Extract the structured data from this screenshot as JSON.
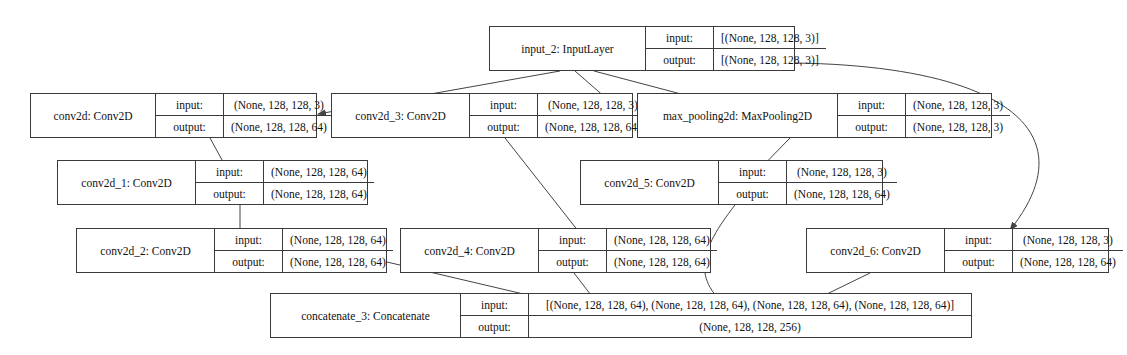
{
  "diagram": {
    "type": "directed-graph",
    "edge_color": "#444444",
    "node_border_color": "#3a3a3a",
    "node_fill": "#ffffff",
    "io_labels": {
      "input": "input:",
      "output": "output:"
    },
    "nodes": [
      {
        "id": "input_2",
        "name": "input_2: InputLayer",
        "input": "[(None, 128, 128, 3)]",
        "output": "[(None, 128, 128, 3)]",
        "x": 489,
        "y": 26,
        "w": 306,
        "h": 45,
        "namew": 141,
        "labelw": 55
      },
      {
        "id": "conv2d",
        "name": "conv2d: Conv2D",
        "input": "(None, 128, 128, 3)",
        "output": "(None, 128, 128, 64)",
        "x": 30,
        "y": 93,
        "w": 287,
        "h": 45,
        "namew": 110,
        "labelw": 55
      },
      {
        "id": "conv2d_3",
        "name": "conv2d_3: Conv2D",
        "input": "(None, 128, 128, 3)",
        "output": "(None, 128, 128, 64)",
        "x": 331,
        "y": 93,
        "w": 302,
        "h": 45,
        "namew": 123,
        "labelw": 55
      },
      {
        "id": "max_pooling2d",
        "name": "max_pooling2d: MaxPooling2D",
        "input": "(None, 128, 128, 3)",
        "output": "(None, 128, 128, 3)",
        "x": 637,
        "y": 93,
        "w": 355,
        "h": 45,
        "namew": 185,
        "labelw": 55
      },
      {
        "id": "conv2d_1",
        "name": "conv2d_1: Conv2D",
        "input": "(None, 128, 128, 64)",
        "output": "(None, 128, 128, 64)",
        "x": 57,
        "y": 160,
        "w": 311,
        "h": 45,
        "namew": 123,
        "labelw": 55
      },
      {
        "id": "conv2d_5",
        "name": "conv2d_5: Conv2D",
        "input": "(None, 128, 128, 3)",
        "output": "(None, 128, 128, 64)",
        "x": 580,
        "y": 160,
        "w": 303,
        "h": 45,
        "namew": 123,
        "labelw": 55
      },
      {
        "id": "conv2d_2",
        "name": "conv2d_2: Conv2D",
        "input": "(None, 128, 128, 64)",
        "output": "(None, 128, 128, 64)",
        "x": 76,
        "y": 228,
        "w": 311,
        "h": 45,
        "namew": 123,
        "labelw": 55
      },
      {
        "id": "conv2d_4",
        "name": "conv2d_4: Conv2D",
        "input": "(None, 128, 128, 64)",
        "output": "(None, 128, 128, 64)",
        "x": 400,
        "y": 228,
        "w": 311,
        "h": 45,
        "namew": 123,
        "labelw": 55
      },
      {
        "id": "conv2d_6",
        "name": "conv2d_6: Conv2D",
        "input": "(None, 128, 128, 3)",
        "output": "(None, 128, 128, 64)",
        "x": 806,
        "y": 228,
        "w": 303,
        "h": 45,
        "namew": 123,
        "labelw": 55
      },
      {
        "id": "concatenate_3",
        "name": "concatenate_3: Concatenate",
        "input": "[(None, 128, 128, 64), (None, 128, 128, 64), (None, 128, 128, 64), (None, 128, 128, 64)]",
        "output": "(None, 128, 128, 256)",
        "x": 270,
        "y": 293,
        "w": 702,
        "h": 45,
        "namew": 175,
        "labelw": 55
      }
    ],
    "edges": [
      {
        "from": "input_2",
        "to": "conv2d",
        "path": "M 560 71 L 318 114"
      },
      {
        "from": "input_2",
        "to": "conv2d_3",
        "path": "M 575 71 L 622 112"
      },
      {
        "from": "input_2",
        "to": "max_pooling2d",
        "path": "M 594 71 L 753 113"
      },
      {
        "from": "input_2",
        "to": "conv2d_6",
        "path": "M 795 63 C 1000 66 1090 130 1010 230"
      },
      {
        "from": "conv2d",
        "to": "conv2d_1",
        "path": "M 210 138 L 233 180"
      },
      {
        "from": "conv2d_3",
        "to": "conv2d_4",
        "path": "M 505 138 L 590 246"
      },
      {
        "from": "max_pooling2d",
        "to": "conv2d_5",
        "path": "M 790 138 L 749 180"
      },
      {
        "from": "conv2d_1",
        "to": "conv2d_2",
        "path": "M 240 205 L 240 246"
      },
      {
        "from": "conv2d_2",
        "to": "concatenate_3",
        "path": "M 387 262 L 600 312"
      },
      {
        "from": "conv2d_4",
        "to": "concatenate_3",
        "path": "M 574 273 L 604 312"
      },
      {
        "from": "conv2d_5",
        "to": "concatenate_3",
        "path": "M 735 205 C 700 250 690 280 733 311"
      },
      {
        "from": "conv2d_6",
        "to": "concatenate_3",
        "path": "M 870 273 L 790 312"
      }
    ]
  }
}
